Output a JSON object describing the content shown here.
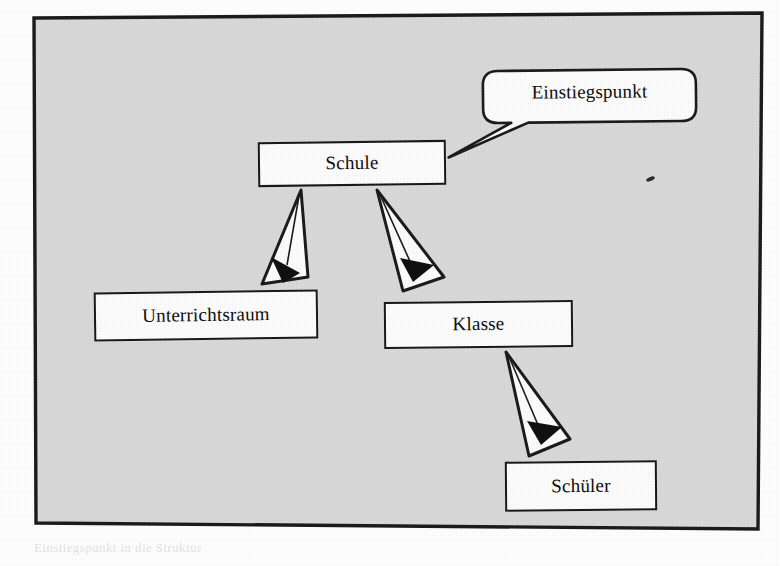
{
  "page": {
    "kind": "scanned-textbook-figure",
    "background_color": "#fdfdfd"
  },
  "figure": {
    "panel_fill": "#d8d8d8",
    "panel_border_color": "#1b1b1d",
    "node_fill": "#fbfbfb",
    "node_border_color": "#18181a",
    "arrow_outline_color": "#1b1b1d",
    "arrow_fill": "#fbfbfb",
    "arrowhead_color": "#101010"
  },
  "nodes": [
    {
      "id": "schule",
      "label": "Schule"
    },
    {
      "id": "unterrichtsraum",
      "label": "Unterrichtsraum"
    },
    {
      "id": "klasse",
      "label": "Klasse"
    },
    {
      "id": "schueler",
      "label": "Schüler"
    }
  ],
  "callout": {
    "id": "einstiegspunkt",
    "label": "Einstiegspunkt",
    "points_to": "schule"
  },
  "edges": [
    {
      "from": "schule",
      "to": "unterrichtsraum"
    },
    {
      "from": "schule",
      "to": "klasse"
    },
    {
      "from": "klasse",
      "to": "schueler"
    }
  ],
  "artifacts": {
    "ink_speck": "ink-speck",
    "ghost_text": [
      "der mehrere Objekte der Klasse",
      "in dem Unterricht stattfindet",
      "zugeordnet sind",
      "Objekte werden erzeugt und",
      "die Beziehungen zwischen den",
      "Klassen dargestellt werden",
      "Das Objekt vom Typ Schule ist der",
      "Einstiegspunkt in die Struktur"
    ]
  }
}
